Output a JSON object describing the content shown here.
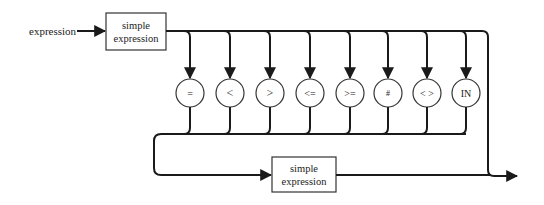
{
  "diagram": {
    "type": "syntax-diagram",
    "entry_label": "expression",
    "top_box": {
      "line1": "simple",
      "line2": "expression"
    },
    "bottom_box": {
      "line1": "simple",
      "line2": "expression"
    },
    "operators": [
      {
        "symbol": "="
      },
      {
        "symbol": "<"
      },
      {
        "symbol": ">"
      },
      {
        "symbol": "<="
      },
      {
        "symbol": ">="
      },
      {
        "symbol": "#"
      },
      {
        "symbol": "< >"
      },
      {
        "symbol": "IN"
      }
    ],
    "colors": {
      "line": "#1a1a1a",
      "background": "#ffffff"
    }
  }
}
